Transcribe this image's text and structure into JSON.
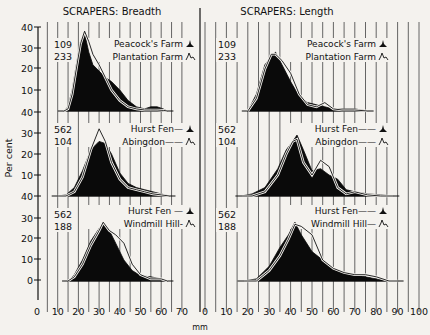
{
  "chart_data": [
    {
      "type": "area",
      "title": "SCRAPERS: Breadth",
      "xlabel": "mm",
      "ylabel": "Per cent",
      "xlim": [
        0,
        70
      ],
      "x_ticks": [
        0,
        10,
        20,
        30,
        40,
        50,
        60,
        70
      ],
      "grid": "vertical lines every 5 mm",
      "panels": [
        {
          "counts": [
            "109",
            "233"
          ],
          "y_ticks": [
            40,
            30,
            20,
            10
          ],
          "ylim": [
            0,
            40
          ],
          "legend": [
            {
              "label": "Peacock's Farm",
              "style": "filled"
            },
            {
              "label": "Plantation Farm",
              "style": "outline"
            }
          ],
          "series": [
            {
              "name": "Peacock's Farm",
              "x": [
                13,
                15,
                17,
                19,
                21,
                23,
                25,
                27,
                30,
                33,
                36,
                40,
                44,
                48,
                52,
                55,
                58,
                61,
                63
              ],
              "values": [
                0,
                2,
                10,
                22,
                33,
                37,
                28,
                22,
                19,
                16,
                14,
                10,
                5,
                2,
                1,
                2,
                2,
                1,
                0
              ]
            },
            {
              "name": "Plantation Farm",
              "x": [
                13,
                15,
                17,
                19,
                21,
                23,
                25,
                27,
                30,
                33,
                36,
                40,
                44,
                48,
                52,
                55,
                58,
                61,
                63
              ],
              "values": [
                0,
                1,
                8,
                20,
                32,
                38,
                33,
                27,
                22,
                16,
                10,
                5,
                2,
                1,
                0.5,
                0.5,
                0.5,
                0.3,
                0
              ]
            }
          ]
        },
        {
          "counts": [
            "562",
            "104"
          ],
          "y_ticks": [
            40,
            30,
            20,
            10
          ],
          "ylim": [
            0,
            40
          ],
          "legend": [
            {
              "label": "Hurst Fen",
              "style": "filled"
            },
            {
              "label": "Abingdon",
              "style": "outline"
            }
          ],
          "series": [
            {
              "name": "Hurst Fen",
              "x": [
                10,
                14,
                18,
                22,
                26,
                30,
                33,
                36,
                40,
                44,
                48,
                52,
                56,
                60,
                64
              ],
              "values": [
                0,
                0.5,
                4,
                12,
                22,
                26,
                25,
                20,
                11,
                6,
                4,
                3,
                2,
                1,
                0
              ]
            },
            {
              "name": "Abingdon",
              "x": [
                10,
                14,
                18,
                22,
                26,
                30,
                33,
                36,
                40,
                44,
                48,
                52,
                56,
                60,
                64
              ],
              "values": [
                0,
                0,
                2,
                9,
                22,
                32,
                26,
                16,
                8,
                4,
                3,
                2,
                1,
                0.5,
                0
              ]
            }
          ]
        },
        {
          "counts": [
            "562",
            "188"
          ],
          "y_ticks": [
            30,
            20,
            10,
            0
          ],
          "ylim": [
            0,
            40
          ],
          "legend": [
            {
              "label": "Hurst Fen",
              "style": "filled"
            },
            {
              "label": "Windmill Hill",
              "style": "outline"
            }
          ],
          "series": [
            {
              "name": "Hurst Fen",
              "x": [
                15,
                18,
                22,
                26,
                30,
                32,
                35,
                38,
                42,
                46,
                50,
                55,
                60,
                63
              ],
              "values": [
                0,
                3,
                10,
                19,
                25,
                27,
                24,
                18,
                10,
                5,
                2.5,
                2,
                1,
                0
              ]
            },
            {
              "name": "Windmill Hill",
              "x": [
                15,
                18,
                22,
                26,
                30,
                32,
                35,
                38,
                42,
                46,
                50,
                55,
                60,
                63
              ],
              "values": [
                0,
                2,
                8,
                17,
                24,
                28,
                24,
                22,
                18,
                8,
                3,
                1,
                1,
                0
              ]
            }
          ]
        }
      ]
    },
    {
      "type": "area",
      "title": "SCRAPERS: Length",
      "xlabel": "mm",
      "xlim": [
        0,
        100
      ],
      "x_ticks": [
        0,
        10,
        20,
        30,
        40,
        50,
        60,
        70,
        80,
        90,
        100
      ],
      "grid": "vertical lines every 5 mm",
      "panels": [
        {
          "counts": [
            "109",
            "233"
          ],
          "legend": [
            {
              "label": "Peacock's Farm",
              "style": "filled"
            },
            {
              "label": "Plantation Farm",
              "style": "outline"
            }
          ],
          "series": [
            {
              "name": "Peacock's Farm",
              "x": [
                20,
                24,
                28,
                31,
                33,
                36,
                40,
                44,
                48,
                52,
                56,
                60,
                64,
                70,
                76
              ],
              "values": [
                0,
                8,
                22,
                26,
                28,
                22,
                14,
                7,
                4,
                3,
                2,
                1,
                1,
                1,
                0
              ]
            },
            {
              "name": "Plantation Farm",
              "x": [
                20,
                24,
                28,
                31,
                33,
                36,
                40,
                44,
                48,
                52,
                56,
                60,
                64,
                70,
                76
              ],
              "values": [
                0,
                6,
                20,
                27,
                27,
                24,
                18,
                8,
                3,
                2,
                4,
                1,
                0.5,
                0.5,
                0
              ]
            }
          ]
        },
        {
          "counts": [
            "562",
            "104"
          ],
          "legend": [
            {
              "label": "Hurst Fen",
              "style": "filled"
            },
            {
              "label": "Abingdon",
              "style": "outline"
            }
          ],
          "series": [
            {
              "name": "Hurst Fen",
              "x": [
                17,
                22,
                28,
                34,
                38,
                41,
                43,
                46,
                50,
                54,
                58,
                62,
                66,
                70,
                76,
                82,
                88
              ],
              "values": [
                0,
                1,
                4,
                13,
                22,
                26,
                29,
                22,
                12,
                13,
                10,
                8,
                3,
                2,
                1,
                0.5,
                0
              ]
            },
            {
              "name": "Abingdon",
              "x": [
                17,
                22,
                28,
                34,
                38,
                41,
                43,
                46,
                50,
                54,
                58,
                62,
                66,
                70,
                76,
                82,
                88
              ],
              "values": [
                0,
                0,
                2,
                10,
                20,
                26,
                27,
                16,
                10,
                17,
                14,
                4,
                1,
                2,
                0.5,
                0,
                0
              ]
            }
          ]
        },
        {
          "counts": [
            "562",
            "188"
          ],
          "legend": [
            {
              "label": "Hurst Fen",
              "style": "filled"
            },
            {
              "label": "Windmill Hill",
              "style": "outline"
            }
          ],
          "series": [
            {
              "name": "Hurst Fen",
              "x": [
                18,
                24,
                30,
                35,
                39,
                42,
                45,
                50,
                55,
                60,
                65,
                70,
                75,
                80,
                86,
                90
              ],
              "values": [
                0,
                1,
                7,
                16,
                22,
                28,
                22,
                14,
                10,
                6,
                4,
                3,
                2,
                1,
                0,
                0
              ]
            },
            {
              "name": "Windmill Hill",
              "x": [
                18,
                24,
                30,
                35,
                39,
                42,
                45,
                50,
                55,
                60,
                65,
                70,
                75,
                80,
                86,
                90
              ],
              "values": [
                0,
                0,
                5,
                12,
                20,
                27,
                26,
                22,
                10,
                6,
                4,
                3,
                3,
                2,
                0,
                0
              ]
            }
          ]
        }
      ]
    }
  ],
  "labels": {
    "title_left": "SCRAPERS: Breadth",
    "title_right": "SCRAPERS: Length",
    "ylabel": "Per cent",
    "xlabel": "mm",
    "left_panels": [
      {
        "n1": "109",
        "n2": "233",
        "leg1": "Peacock's Farm",
        "leg2": "Plantation Farm"
      },
      {
        "n1": "562",
        "n2": "104",
        "leg1": "Hurst Fen—",
        "leg2": "Abingdon——"
      },
      {
        "n1": "562",
        "n2": "188",
        "leg1": "Hurst Fen —",
        "leg2": "Windmill Hill-"
      }
    ],
    "right_panels": [
      {
        "n1": "109",
        "n2": "233",
        "leg1": "Peacock's Farm",
        "leg2": "Plantation Farm"
      },
      {
        "n1": "562",
        "n2": "104",
        "leg1": "Hurst Fen——",
        "leg2": "Abingdon——"
      },
      {
        "n1": "562",
        "n2": "188",
        "leg1": "Hurst Fen——",
        "leg2": "Windmill Hill—"
      }
    ],
    "y_tick_labels": [
      "40",
      "30",
      "20",
      "10",
      "40",
      "30",
      "20",
      "10",
      "40",
      "30",
      "20",
      "10",
      "0"
    ],
    "x_ticks_left": [
      "0",
      "10",
      "20",
      "30",
      "40",
      "50",
      "60",
      "70"
    ],
    "x_ticks_right": [
      "0",
      "10",
      "20",
      "30",
      "40",
      "50",
      "60",
      "70",
      "80",
      "90",
      "100"
    ]
  }
}
